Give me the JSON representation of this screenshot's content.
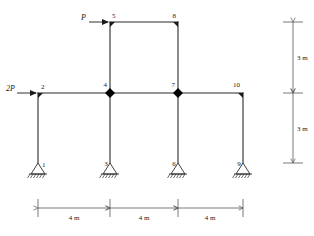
{
  "figure": {
    "stroke_color": "#2b2b2b",
    "node_fill_color": "#000000",
    "background_color": "#ffffff"
  },
  "nodes": [
    {
      "id": "1",
      "label": "1",
      "type": "pinned-support",
      "x_m": 0,
      "y_m": 0
    },
    {
      "id": "2",
      "label": "2",
      "type": "joint",
      "x_m": 0,
      "y_m": 3
    },
    {
      "id": "3",
      "label": "3",
      "type": "pinned-support",
      "x_m": 4,
      "y_m": 0
    },
    {
      "id": "4",
      "label": "4",
      "type": "hinge",
      "x_m": 4,
      "y_m": 3
    },
    {
      "id": "5",
      "label": "5",
      "type": "joint",
      "x_m": 4,
      "y_m": 6
    },
    {
      "id": "6",
      "label": "6",
      "type": "pinned-support",
      "x_m": 8,
      "y_m": 0
    },
    {
      "id": "7",
      "label": "7",
      "type": "hinge",
      "x_m": 8,
      "y_m": 3
    },
    {
      "id": "8",
      "label": "8",
      "type": "joint",
      "x_m": 8,
      "y_m": 6
    },
    {
      "id": "9",
      "label": "9",
      "type": "pinned-support",
      "x_m": 12,
      "y_m": 0
    },
    {
      "id": "10",
      "label": "10",
      "type": "joint",
      "x_m": 12,
      "y_m": 3
    }
  ],
  "members": [
    {
      "from": "1",
      "to": "2",
      "kind": "column"
    },
    {
      "from": "3",
      "to": "4",
      "kind": "column"
    },
    {
      "from": "4",
      "to": "5",
      "kind": "column"
    },
    {
      "from": "6",
      "to": "7",
      "kind": "column"
    },
    {
      "from": "7",
      "to": "8",
      "kind": "column"
    },
    {
      "from": "9",
      "to": "10",
      "kind": "column"
    },
    {
      "from": "2",
      "to": "4",
      "kind": "beam"
    },
    {
      "from": "4",
      "to": "7",
      "kind": "beam"
    },
    {
      "from": "7",
      "to": "10",
      "kind": "beam"
    },
    {
      "from": "5",
      "to": "8",
      "kind": "beam"
    }
  ],
  "loads": [
    {
      "id": "load-P",
      "label": "P",
      "applied_to": "5",
      "direction": "right"
    },
    {
      "id": "load-2P",
      "label": "2P",
      "applied_to": "2",
      "direction": "right"
    }
  ],
  "dimensions": {
    "horizontal": [
      {
        "label": "4 m",
        "from_node": "1",
        "to_node": "3"
      },
      {
        "label": "4 m",
        "from_node": "3",
        "to_node": "6"
      },
      {
        "label": "4 m",
        "from_node": "6",
        "to_node": "9"
      }
    ],
    "vertical": [
      {
        "label": "3 m",
        "segment": "upper-story"
      },
      {
        "label": "3 m",
        "segment": "lower-story"
      }
    ]
  }
}
